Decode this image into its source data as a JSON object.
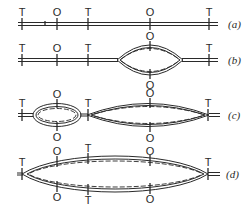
{
  "diagram": {
    "type": "replication-bubble-schematic",
    "legend": {
      "T": "T",
      "O": "O"
    },
    "rows": [
      {
        "caption": "(a)",
        "description": "linear double-stranded DNA, no bubbles",
        "top_labels": [
          "T",
          "O",
          "T",
          "O",
          "T"
        ],
        "bottom_labels": []
      },
      {
        "caption": "(b)",
        "description": "one replication bubble at second origin",
        "top_labels": [
          "T",
          "O",
          "T",
          "O",
          "T"
        ],
        "bottom_labels": [
          "O"
        ]
      },
      {
        "caption": "(c)",
        "description": "two replication bubbles",
        "top_labels": [
          "T",
          "O",
          "T",
          "O",
          "T"
        ],
        "bottom_labels": [
          "O",
          "O"
        ]
      },
      {
        "caption": "(d)",
        "description": "bubbles merged into one large replicated region",
        "top_labels": [
          "T",
          "O",
          "T",
          "O",
          "T"
        ],
        "bottom_labels": [
          "O",
          "T",
          "O"
        ]
      }
    ]
  }
}
